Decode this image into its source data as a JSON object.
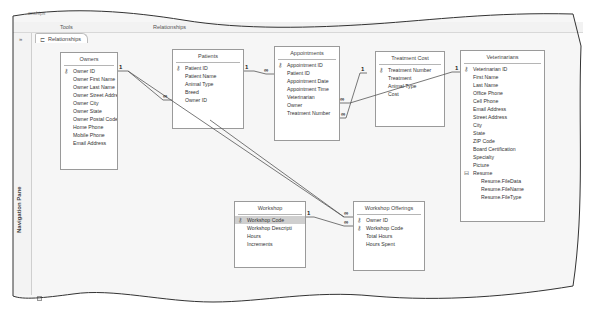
{
  "window": {
    "title_fragment": "onships",
    "ribbon": {
      "context_group": "Tools",
      "context_tab": "Relationships"
    }
  },
  "nav_pane": {
    "toggle": "»",
    "label": "Navigation Pane"
  },
  "document_tab": {
    "icon": "relationships-icon",
    "label": "Relationships"
  },
  "tables": [
    {
      "name": "Owners",
      "fields": [
        {
          "label": "Owner ID",
          "key": true
        },
        {
          "label": "Owner First Name"
        },
        {
          "label": "Owner Last Name"
        },
        {
          "label": "Owner Street Addres"
        },
        {
          "label": "Owner City"
        },
        {
          "label": "Owner State"
        },
        {
          "label": "Owner Postal Code"
        },
        {
          "label": "Home Phone"
        },
        {
          "label": "Mobile Phone"
        },
        {
          "label": "Email Address"
        }
      ]
    },
    {
      "name": "Patients",
      "fields": [
        {
          "label": "Patient ID",
          "key": true
        },
        {
          "label": "Patient Name"
        },
        {
          "label": "Animal Type"
        },
        {
          "label": "Breed"
        },
        {
          "label": "Owner ID"
        }
      ]
    },
    {
      "name": "Appointments",
      "fields": [
        {
          "label": "Appointment ID",
          "key": true
        },
        {
          "label": "Patient ID"
        },
        {
          "label": "Appointment Date"
        },
        {
          "label": "Appointment Time"
        },
        {
          "label": "Veterinarian"
        },
        {
          "label": "Owner"
        },
        {
          "label": "Treatment Number"
        }
      ]
    },
    {
      "name": "Treatment Cost",
      "fields": [
        {
          "label": "Treatment Number",
          "key": true
        },
        {
          "label": "Treatment"
        },
        {
          "label": "Animal Type"
        },
        {
          "label": "Cost"
        }
      ]
    },
    {
      "name": "Veterinarians",
      "fields": [
        {
          "label": "Veterinarian ID",
          "key": true
        },
        {
          "label": "First Name"
        },
        {
          "label": "Last Name"
        },
        {
          "label": "Office Phone"
        },
        {
          "label": "Cell Phone"
        },
        {
          "label": "Email Address"
        },
        {
          "label": "Street Address"
        },
        {
          "label": "City"
        },
        {
          "label": "State"
        },
        {
          "label": "ZIP Code"
        },
        {
          "label": "Board Certification"
        },
        {
          "label": "Specialty"
        },
        {
          "label": "Picture"
        },
        {
          "label": "Resume",
          "group": true
        },
        {
          "label": "Resume.FileData",
          "sub": true
        },
        {
          "label": "Resume.FileName",
          "sub": true
        },
        {
          "label": "Resume.FileType",
          "sub": true
        }
      ]
    },
    {
      "name": "Workshop",
      "fields": [
        {
          "label": "Workshop Code",
          "key": true,
          "selected": true
        },
        {
          "label": "Workshop Descripti"
        },
        {
          "label": "Hours"
        },
        {
          "label": "Increments"
        }
      ]
    },
    {
      "name": "Workshop Offerings",
      "fields": [
        {
          "label": "Owner ID",
          "key": true
        },
        {
          "label": "Workshop Code",
          "key": true
        },
        {
          "label": "Total Hours"
        },
        {
          "label": "Hours Spent"
        }
      ]
    }
  ],
  "relationships": [
    {
      "from": "Owners.Owner ID",
      "to": "Patients.Owner ID",
      "one": "1",
      "many": "∞"
    },
    {
      "from": "Owners.Owner ID",
      "to": "Workshop Offerings.Owner ID",
      "one": "1",
      "many": "∞"
    },
    {
      "from": "Patients.Patient ID",
      "to": "Appointments.Patient ID",
      "one": "1",
      "many": "∞"
    },
    {
      "from": "Treatment Cost.Treatment Number",
      "to": "Appointments.Treatment Number",
      "one": "1",
      "many": "∞"
    },
    {
      "from": "Veterinarians.Veterinarian ID",
      "to": "Appointments.Veterinarian",
      "one": "1",
      "many": "∞"
    },
    {
      "from": "Workshop.Workshop Code",
      "to": "Workshop Offerings.Workshop Code",
      "one": "1",
      "many": "∞"
    }
  ],
  "symbols": {
    "key": "⚷",
    "group_collapse": "⊟",
    "one": "1",
    "many": "∞"
  }
}
